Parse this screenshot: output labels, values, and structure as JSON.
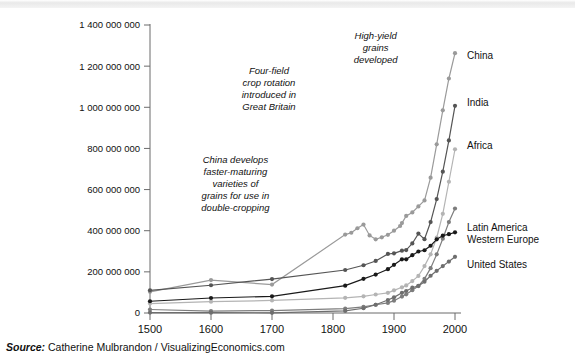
{
  "source": {
    "label": "Source:",
    "text": " Catherine Mulbrandon / VisualizingEconomics.com"
  },
  "chart_data": {
    "type": "line",
    "title": "",
    "xlabel": "",
    "ylabel": "",
    "xlim": [
      1500,
      2010
    ],
    "ylim": [
      0,
      1400000000
    ],
    "grid": false,
    "legend_position": "right-inline",
    "xticks": [
      "1500",
      "1600",
      "1700",
      "1800",
      "1900",
      "2000"
    ],
    "xtick_values": [
      1500,
      1600,
      1700,
      1800,
      1900,
      2000
    ],
    "yticks": [
      "0",
      "200 000 000",
      "400 000 000",
      "600 000 000",
      "800 000 000",
      "1 000 000 000",
      "1 200 000 000",
      "1 400 000 000"
    ],
    "ytick_values": [
      0,
      200000000,
      400000000,
      600000000,
      800000000,
      1000000000,
      1200000000,
      1400000000
    ],
    "annotations": [
      {
        "name": "high-yield-grains",
        "lines": [
          "High-yield",
          "grains",
          "developed"
        ],
        "x": 1870,
        "y": 1330000000
      },
      {
        "name": "four-field-crop-rotation",
        "lines": [
          "Four-field",
          "crop rotation",
          "introduced in",
          "Great Britain"
        ],
        "x": 1695,
        "y": 1160000000
      },
      {
        "name": "china-double-cropping",
        "lines": [
          "China develops",
          "faster-maturing",
          "varieties of",
          "grains for use in",
          "double-cropping"
        ],
        "x": 1640,
        "y": 730000000
      }
    ],
    "series": [
      {
        "name": "China",
        "color": "#9a9a9a",
        "label": "China",
        "x": [
          1500,
          1600,
          1700,
          1820,
          1830,
          1840,
          1850,
          1860,
          1870,
          1880,
          1890,
          1900,
          1910,
          1913,
          1920,
          1930,
          1940,
          1950,
          1960,
          1970,
          1980,
          1990,
          2000
        ],
        "values": [
          103000000,
          160000000,
          138000000,
          381000000,
          390000000,
          412000000,
          430000000,
          377000000,
          358000000,
          368000000,
          380000000,
          400000000,
          423000000,
          437000000,
          472000000,
          489000000,
          518000000,
          547000000,
          658000000,
          820000000,
          985000000,
          1140000000,
          1263000000
        ]
      },
      {
        "name": "India",
        "color": "#555555",
        "label": "India",
        "x": [
          1500,
          1600,
          1700,
          1820,
          1850,
          1870,
          1890,
          1900,
          1913,
          1920,
          1930,
          1940,
          1950,
          1960,
          1970,
          1980,
          1990,
          2000
        ],
        "values": [
          110000000,
          135000000,
          165000000,
          209000000,
          232000000,
          253000000,
          287000000,
          290000000,
          303000000,
          306000000,
          338000000,
          386000000,
          359000000,
          442000000,
          554000000,
          687000000,
          839000000,
          1007000000
        ]
      },
      {
        "name": "Africa",
        "color": "#b4b4b4",
        "label": "Africa",
        "x": [
          1500,
          1600,
          1700,
          1820,
          1850,
          1870,
          1890,
          1900,
          1913,
          1920,
          1930,
          1940,
          1950,
          1960,
          1970,
          1980,
          1990,
          2000
        ],
        "values": [
          46000000,
          55000000,
          61000000,
          74000000,
          81000000,
          90000000,
          98000000,
          110000000,
          125000000,
          134000000,
          155000000,
          180000000,
          228000000,
          285000000,
          366000000,
          482000000,
          638000000,
          796000000
        ]
      },
      {
        "name": "Latin America",
        "color": "#7d7d7d",
        "label": "Latin America",
        "x": [
          1500,
          1600,
          1700,
          1820,
          1850,
          1870,
          1890,
          1900,
          1913,
          1920,
          1930,
          1940,
          1950,
          1960,
          1970,
          1980,
          1990,
          2000
        ],
        "values": [
          17000000,
          9000000,
          12000000,
          21000000,
          30000000,
          40000000,
          49000000,
          60000000,
          80000000,
          91000000,
          111000000,
          131000000,
          166000000,
          218000000,
          285000000,
          361000000,
          442000000,
          508000000
        ]
      },
      {
        "name": "Western Europe",
        "color": "#1a1a1a",
        "label": "Western Europe",
        "x": [
          1500,
          1600,
          1700,
          1820,
          1850,
          1870,
          1890,
          1900,
          1913,
          1920,
          1930,
          1940,
          1950,
          1960,
          1970,
          1980,
          1990,
          2000
        ],
        "values": [
          57000000,
          73000000,
          81000000,
          133000000,
          166000000,
          187000000,
          213000000,
          234000000,
          261000000,
          261000000,
          281000000,
          299000000,
          305000000,
          327000000,
          358000000,
          376000000,
          383000000,
          392000000
        ]
      },
      {
        "name": "United States",
        "color": "#6e6e6e",
        "label": "United States",
        "x": [
          1500,
          1600,
          1700,
          1820,
          1850,
          1870,
          1890,
          1900,
          1913,
          1920,
          1930,
          1940,
          1950,
          1960,
          1970,
          1980,
          1990,
          2000
        ],
        "values": [
          2000000,
          1500000,
          1000000,
          10000000,
          23000000,
          40000000,
          63000000,
          76000000,
          98000000,
          107000000,
          123000000,
          132000000,
          152000000,
          181000000,
          205000000,
          228000000,
          250000000,
          273000000
        ]
      }
    ]
  }
}
